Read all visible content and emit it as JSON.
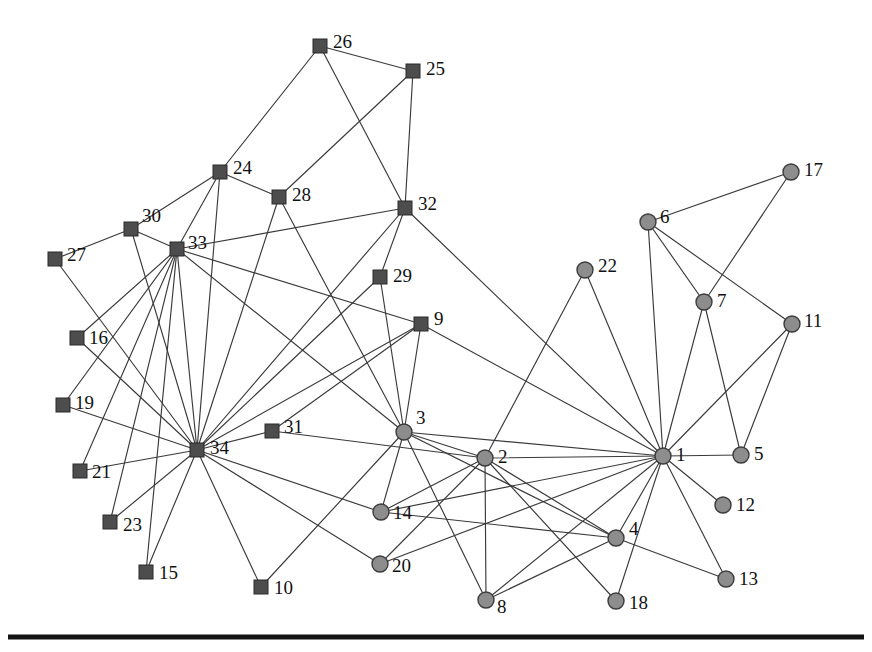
{
  "figure": {
    "width": 872,
    "height": 652,
    "background_color": "#ffffff",
    "edge_color": "#3a3a3a",
    "square_node_color": "#4d4d4d",
    "circle_node_color": "#8d8d8d",
    "label_color": "#111111",
    "rule_color": "#141414",
    "rule": {
      "x1": 8,
      "y1": 637,
      "x2": 864,
      "y2": 637
    }
  },
  "chart_data": {
    "type": "scatter",
    "xlabel": "",
    "ylabel": "",
    "legend_position": "none",
    "grid": false,
    "node_shapes": {
      "square": "dark-gray-square",
      "circle": "medium-gray-circle"
    },
    "nodes": [
      {
        "id": 1,
        "label": "1",
        "shape": "circle",
        "x": 663,
        "y": 456,
        "label_dx": 13,
        "label_dy": 1
      },
      {
        "id": 2,
        "label": "2",
        "shape": "circle",
        "x": 485,
        "y": 458,
        "label_dx": 13,
        "label_dy": 1
      },
      {
        "id": 3,
        "label": "3",
        "shape": "circle",
        "x": 404,
        "y": 432,
        "label_dx": 12,
        "label_dy": -12
      },
      {
        "id": 4,
        "label": "4",
        "shape": "circle",
        "x": 616,
        "y": 538,
        "label_dx": 13,
        "label_dy": -7
      },
      {
        "id": 5,
        "label": "5",
        "shape": "circle",
        "x": 741,
        "y": 455,
        "label_dx": 13,
        "label_dy": 1
      },
      {
        "id": 6,
        "label": "6",
        "shape": "circle",
        "x": 648,
        "y": 222,
        "label_dx": 12,
        "label_dy": -3
      },
      {
        "id": 7,
        "label": "7",
        "shape": "circle",
        "x": 704,
        "y": 302,
        "label_dx": 13,
        "label_dy": 1
      },
      {
        "id": 8,
        "label": "8",
        "shape": "circle",
        "x": 486,
        "y": 600,
        "label_dx": 11,
        "label_dy": 9
      },
      {
        "id": 9,
        "label": "9",
        "shape": "square",
        "x": 421,
        "y": 324,
        "label_dx": 13,
        "label_dy": -3
      },
      {
        "id": 10,
        "label": "10",
        "shape": "square",
        "x": 261,
        "y": 587,
        "label_dx": 13,
        "label_dy": 3
      },
      {
        "id": 11,
        "label": "11",
        "shape": "circle",
        "x": 792,
        "y": 324,
        "label_dx": 12,
        "label_dy": -1
      },
      {
        "id": 12,
        "label": "12",
        "shape": "circle",
        "x": 723,
        "y": 505,
        "label_dx": 13,
        "label_dy": 2
      },
      {
        "id": 13,
        "label": "13",
        "shape": "circle",
        "x": 726,
        "y": 579,
        "label_dx": 13,
        "label_dy": 2
      },
      {
        "id": 14,
        "label": "14",
        "shape": "circle",
        "x": 381,
        "y": 512,
        "label_dx": 12,
        "label_dy": 3
      },
      {
        "id": 15,
        "label": "15",
        "shape": "square",
        "x": 146,
        "y": 572,
        "label_dx": 13,
        "label_dy": 3
      },
      {
        "id": 16,
        "label": "16",
        "shape": "square",
        "x": 77,
        "y": 338,
        "label_dx": 12,
        "label_dy": 2
      },
      {
        "id": 17,
        "label": "17",
        "shape": "circle",
        "x": 791,
        "y": 172,
        "label_dx": 13,
        "label_dy": 0
      },
      {
        "id": 18,
        "label": "18",
        "shape": "circle",
        "x": 616,
        "y": 601,
        "label_dx": 13,
        "label_dy": 4
      },
      {
        "id": 19,
        "label": "19",
        "shape": "square",
        "x": 63,
        "y": 405,
        "label_dx": 12,
        "label_dy": 0
      },
      {
        "id": 20,
        "label": "20",
        "shape": "circle",
        "x": 380,
        "y": 564,
        "label_dx": 12,
        "label_dy": 4
      },
      {
        "id": 21,
        "label": "21",
        "shape": "square",
        "x": 80,
        "y": 471,
        "label_dx": 12,
        "label_dy": 3
      },
      {
        "id": 22,
        "label": "22",
        "shape": "circle",
        "x": 585,
        "y": 270,
        "label_dx": 13,
        "label_dy": -2
      },
      {
        "id": 23,
        "label": "23",
        "shape": "square",
        "x": 110,
        "y": 522,
        "label_dx": 13,
        "label_dy": 5
      },
      {
        "id": 24,
        "label": "24",
        "shape": "square",
        "x": 220,
        "y": 172,
        "label_dx": 13,
        "label_dy": -2
      },
      {
        "id": 25,
        "label": "25",
        "shape": "square",
        "x": 413,
        "y": 71,
        "label_dx": 13,
        "label_dy": 0
      },
      {
        "id": 26,
        "label": "26",
        "shape": "square",
        "x": 320,
        "y": 46,
        "label_dx": 13,
        "label_dy": -2
      },
      {
        "id": 27,
        "label": "27",
        "shape": "square",
        "x": 55,
        "y": 259,
        "label_dx": 12,
        "label_dy": -2
      },
      {
        "id": 28,
        "label": "28",
        "shape": "square",
        "x": 279,
        "y": 197,
        "label_dx": 13,
        "label_dy": 0
      },
      {
        "id": 29,
        "label": "29",
        "shape": "square",
        "x": 380,
        "y": 277,
        "label_dx": 13,
        "label_dy": 1
      },
      {
        "id": 30,
        "label": "30",
        "shape": "square",
        "x": 131,
        "y": 229,
        "label_dx": 11,
        "label_dy": -11
      },
      {
        "id": 31,
        "label": "31",
        "shape": "square",
        "x": 272,
        "y": 431,
        "label_dx": 12,
        "label_dy": -2
      },
      {
        "id": 32,
        "label": "32",
        "shape": "square",
        "x": 405,
        "y": 208,
        "label_dx": 13,
        "label_dy": -2
      },
      {
        "id": 33,
        "label": "33",
        "shape": "square",
        "x": 177,
        "y": 249,
        "label_dx": 11,
        "label_dy": -4
      },
      {
        "id": 34,
        "label": "34",
        "shape": "square",
        "x": 197,
        "y": 450,
        "label_dx": 13,
        "label_dy": 0
      }
    ],
    "edges": [
      [
        1,
        2
      ],
      [
        1,
        3
      ],
      [
        1,
        4
      ],
      [
        1,
        5
      ],
      [
        1,
        6
      ],
      [
        1,
        7
      ],
      [
        1,
        8
      ],
      [
        1,
        9
      ],
      [
        1,
        11
      ],
      [
        1,
        12
      ],
      [
        1,
        13
      ],
      [
        1,
        14
      ],
      [
        1,
        18
      ],
      [
        1,
        20
      ],
      [
        1,
        22
      ],
      [
        1,
        32
      ],
      [
        2,
        3
      ],
      [
        2,
        4
      ],
      [
        2,
        8
      ],
      [
        2,
        14
      ],
      [
        2,
        18
      ],
      [
        2,
        20
      ],
      [
        2,
        22
      ],
      [
        2,
        31
      ],
      [
        3,
        4
      ],
      [
        3,
        8
      ],
      [
        3,
        9
      ],
      [
        3,
        10
      ],
      [
        3,
        14
      ],
      [
        3,
        28
      ],
      [
        3,
        29
      ],
      [
        3,
        33
      ],
      [
        4,
        8
      ],
      [
        4,
        13
      ],
      [
        4,
        14
      ],
      [
        5,
        7
      ],
      [
        5,
        11
      ],
      [
        6,
        7
      ],
      [
        6,
        11
      ],
      [
        6,
        17
      ],
      [
        7,
        17
      ],
      [
        9,
        31
      ],
      [
        9,
        33
      ],
      [
        9,
        34
      ],
      [
        10,
        34
      ],
      [
        14,
        34
      ],
      [
        15,
        33
      ],
      [
        15,
        34
      ],
      [
        16,
        33
      ],
      [
        16,
        34
      ],
      [
        19,
        33
      ],
      [
        19,
        34
      ],
      [
        20,
        34
      ],
      [
        21,
        33
      ],
      [
        21,
        34
      ],
      [
        23,
        33
      ],
      [
        23,
        34
      ],
      [
        24,
        26
      ],
      [
        24,
        28
      ],
      [
        24,
        30
      ],
      [
        24,
        33
      ],
      [
        24,
        34
      ],
      [
        25,
        26
      ],
      [
        25,
        28
      ],
      [
        25,
        32
      ],
      [
        26,
        32
      ],
      [
        27,
        30
      ],
      [
        27,
        34
      ],
      [
        28,
        34
      ],
      [
        29,
        32
      ],
      [
        29,
        34
      ],
      [
        30,
        33
      ],
      [
        30,
        34
      ],
      [
        31,
        34
      ],
      [
        32,
        33
      ],
      [
        32,
        34
      ],
      [
        33,
        34
      ]
    ]
  }
}
